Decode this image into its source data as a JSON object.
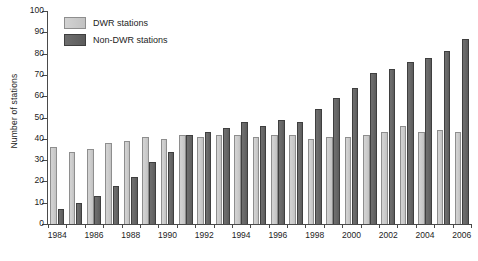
{
  "chart_data": {
    "type": "bar",
    "title": "",
    "xlabel": "",
    "ylabel": "Number of stations",
    "ylim": [
      0,
      100
    ],
    "ytick_values": [
      0,
      10,
      20,
      30,
      40,
      50,
      60,
      70,
      80,
      90,
      100
    ],
    "ytick_labels": [
      "0",
      "10",
      "20",
      "30",
      "40",
      "50",
      "60",
      "70",
      "80",
      "90",
      "100"
    ],
    "grid": false,
    "legend_position": "top-left",
    "categories": [
      "1984",
      "1985",
      "1986",
      "1987",
      "1988",
      "1989",
      "1990",
      "1991",
      "1992",
      "1993",
      "1994",
      "1995",
      "1996",
      "1997",
      "1998",
      "1999",
      "2000",
      "2001",
      "2002",
      "2003",
      "2004",
      "2005",
      "2006"
    ],
    "xtick_labels": [
      "1984",
      "1986",
      "1988",
      "1990",
      "1992",
      "1994",
      "1996",
      "1998",
      "2000",
      "2002",
      "2004",
      "2006"
    ],
    "series": [
      {
        "name": "DWR stations",
        "color": "#cbcbcb",
        "values": [
          36,
          34,
          35,
          38,
          39,
          41,
          40,
          42,
          41,
          42,
          42,
          41,
          42,
          42,
          40,
          41,
          41,
          42,
          43,
          46,
          43,
          44,
          43
        ]
      },
      {
        "name": "Non-DWR stations",
        "color": "#666666",
        "values": [
          7,
          10,
          13,
          18,
          22,
          29,
          34,
          42,
          43,
          45,
          48,
          46,
          49,
          48,
          54,
          59,
          64,
          71,
          73,
          76,
          78,
          81,
          87
        ]
      }
    ]
  },
  "legend": {
    "items": [
      {
        "label": "DWR stations",
        "swatch": "light"
      },
      {
        "label": "Non-DWR stations",
        "swatch": "dark"
      }
    ]
  }
}
